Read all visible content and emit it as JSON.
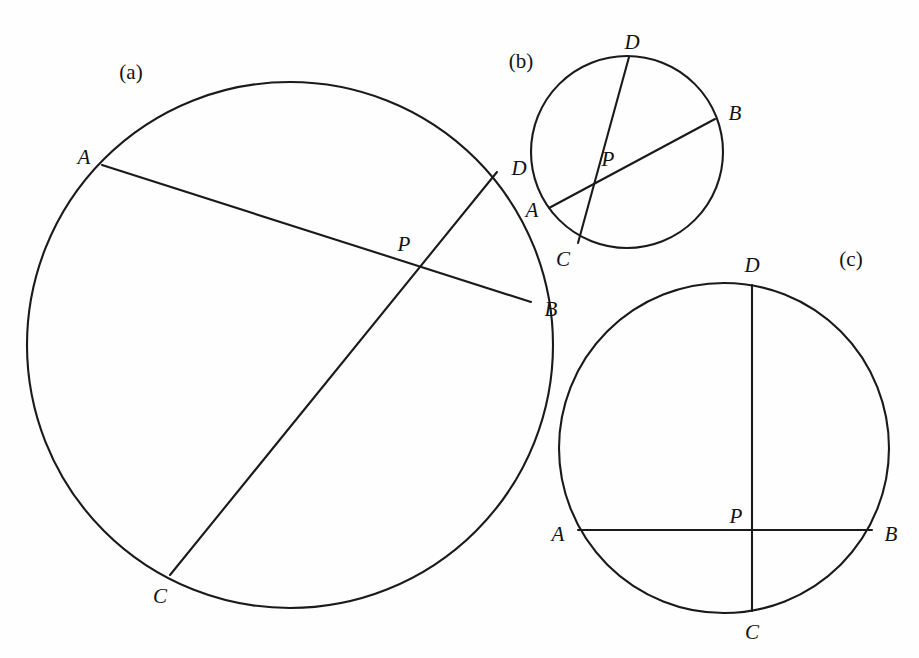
{
  "figure": {
    "background_color": "#fefefe",
    "stroke_color": "#1a1a1a",
    "panels": [
      {
        "id": "a",
        "caption": "(a)",
        "caption_pos": {
          "x": 131,
          "y": 72
        },
        "circle": {
          "cx": 290,
          "cy": 345,
          "r": 263
        },
        "points": [
          {
            "name": "A",
            "x": 102,
            "y": 165,
            "label_x": 84,
            "label_y": 157
          },
          {
            "name": "D",
            "x": 497,
            "y": 172,
            "label_x": 519,
            "label_y": 168
          },
          {
            "name": "P",
            "x": 401,
            "y": 259,
            "label_x": 404,
            "label_y": 244
          },
          {
            "name": "B",
            "x": 531,
            "y": 302,
            "label_x": 551,
            "label_y": 309
          },
          {
            "name": "C",
            "x": 170,
            "y": 575,
            "label_x": 160,
            "label_y": 596
          }
        ],
        "chords": [
          {
            "name": "AB",
            "from": "A",
            "to": "B"
          },
          {
            "name": "CD",
            "from": "C",
            "to": "D"
          }
        ]
      },
      {
        "id": "b",
        "caption": "(b)",
        "caption_pos": {
          "x": 521,
          "y": 61
        },
        "circle": {
          "cx": 627,
          "cy": 152,
          "r": 96
        },
        "points": [
          {
            "name": "D",
            "x": 629,
            "y": 57,
            "label_x": 632,
            "label_y": 42
          },
          {
            "name": "B",
            "x": 715,
            "y": 119,
            "label_x": 735,
            "label_y": 113
          },
          {
            "name": "P",
            "x": 626,
            "y": 171,
            "label_x": 608,
            "label_y": 159
          },
          {
            "name": "A",
            "x": 549,
            "y": 208,
            "label_x": 532,
            "label_y": 210
          },
          {
            "name": "C",
            "x": 578,
            "y": 243,
            "label_x": 563,
            "label_y": 259
          }
        ],
        "chords": [
          {
            "name": "AB",
            "from": "A",
            "to": "B"
          },
          {
            "name": "CD",
            "from": "C",
            "to": "D"
          }
        ]
      },
      {
        "id": "c",
        "caption": "(c)",
        "caption_pos": {
          "x": 851,
          "y": 259
        },
        "circle": {
          "cx": 724,
          "cy": 448,
          "r": 165
        },
        "points": [
          {
            "name": "D",
            "x": 752,
            "y": 285,
            "label_x": 752,
            "label_y": 265
          },
          {
            "name": "A",
            "x": 578,
            "y": 530,
            "label_x": 558,
            "label_y": 534
          },
          {
            "name": "P",
            "x": 752,
            "y": 530,
            "label_x": 736,
            "label_y": 516
          },
          {
            "name": "B",
            "x": 872,
            "y": 530,
            "label_x": 891,
            "label_y": 534
          },
          {
            "name": "C",
            "x": 752,
            "y": 611,
            "label_x": 752,
            "label_y": 632
          }
        ],
        "chords": [
          {
            "name": "AB",
            "from": "A",
            "to": "B"
          },
          {
            "name": "CD",
            "from": "C",
            "to": "D"
          }
        ]
      }
    ]
  }
}
